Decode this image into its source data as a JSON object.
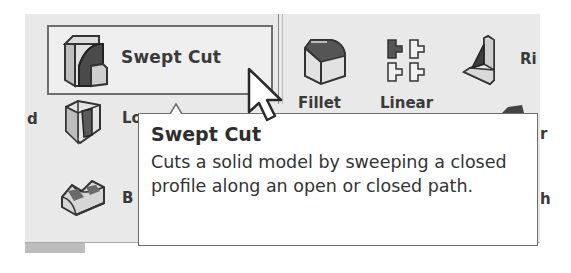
{
  "ribbon": {
    "swept_cut": {
      "label": "Swept Cut",
      "icon": "swept-cut-icon",
      "state": "hovered"
    },
    "fillet": {
      "label": "Fillet",
      "icon": "fillet-icon"
    },
    "linear": {
      "label": "Linear",
      "icon": "linear-pattern-icon"
    },
    "rib": {
      "label": "Rib",
      "visible_text": "Ri",
      "icon": "rib-icon"
    },
    "loft": {
      "visible_text": "Lo",
      "icon": "lofted-cut-icon"
    },
    "boundary": {
      "visible_text": "B",
      "icon": "boundary-cut-icon"
    },
    "left_clipped": {
      "visible_text": "d"
    },
    "right_clipped_1": {
      "visible_text": "r"
    },
    "right_clipped_2": {
      "visible_text": "h"
    }
  },
  "tooltip": {
    "title": "Swept Cut",
    "body": "Cuts a solid model by sweeping a closed profile along an open or closed path."
  },
  "colors": {
    "ribbon_bg": "#e9e9e9",
    "border": "#6e6e6e",
    "text": "#3a3a3a",
    "tooltip_bg": "#ffffff"
  }
}
